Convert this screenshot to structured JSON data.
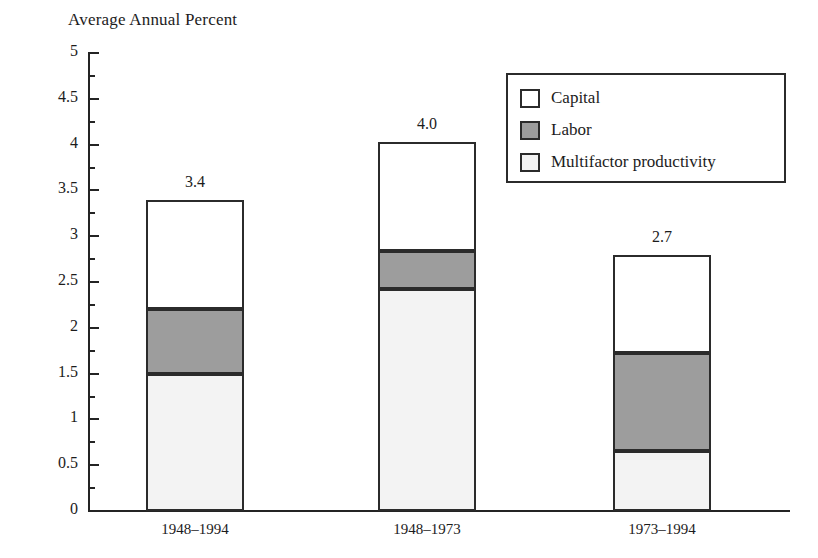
{
  "chart_data": {
    "type": "bar",
    "title": "Average Annual Percent",
    "xlabel": "",
    "ylabel": "",
    "ylim": [
      0,
      5
    ],
    "ytick_step": 0.5,
    "grid": false,
    "stacked": true,
    "legend_position": "top-right",
    "categories": [
      "1948–1994",
      "1948–1973",
      "1973–1994"
    ],
    "series": [
      {
        "name": "Multifactor productivity",
        "values": [
          1.5,
          2.42,
          0.65
        ],
        "color": "#f3f3f3"
      },
      {
        "name": "Labor",
        "values": [
          0.7,
          0.42,
          1.07
        ],
        "color": "#9d9d9d"
      },
      {
        "name": "Capital",
        "values": [
          1.2,
          1.19,
          1.07
        ],
        "color": "#ffffff"
      }
    ],
    "totals": [
      3.4,
      4.03,
      2.79
    ],
    "total_labels": [
      "3.4",
      "4.0",
      "2.7"
    ],
    "ytick_labels": [
      "5",
      "4.5",
      "4",
      "3.5",
      "3",
      "2.5",
      "2",
      "1.5",
      "1",
      "0.5",
      "0"
    ],
    "ytick_values": [
      5,
      4.5,
      4,
      3.5,
      3,
      2.5,
      2,
      1.5,
      1,
      0.5,
      0
    ],
    "yminor_values": [
      4.75,
      4.25,
      3.75,
      3.25,
      2.75,
      2.25,
      1.75,
      1.25,
      0.75,
      0.25
    ],
    "axis_color": "#242424",
    "bar_outline_color": "#2b2b2b"
  },
  "legend": {
    "items": [
      {
        "label": "Capital",
        "color": "#ffffff"
      },
      {
        "label": "Labor",
        "color": "#9d9d9d"
      },
      {
        "label": "Multifactor productivity",
        "color": "#f3f3f3"
      }
    ]
  }
}
